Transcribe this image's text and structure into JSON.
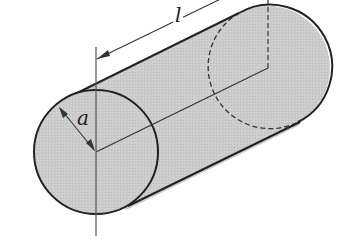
{
  "figure": {
    "labels": {
      "radius": "a",
      "length": "l"
    },
    "colors": {
      "fill": "#c8c8c8",
      "stroke": "#222222",
      "axis": "#555555",
      "background": "#ffffff"
    }
  }
}
